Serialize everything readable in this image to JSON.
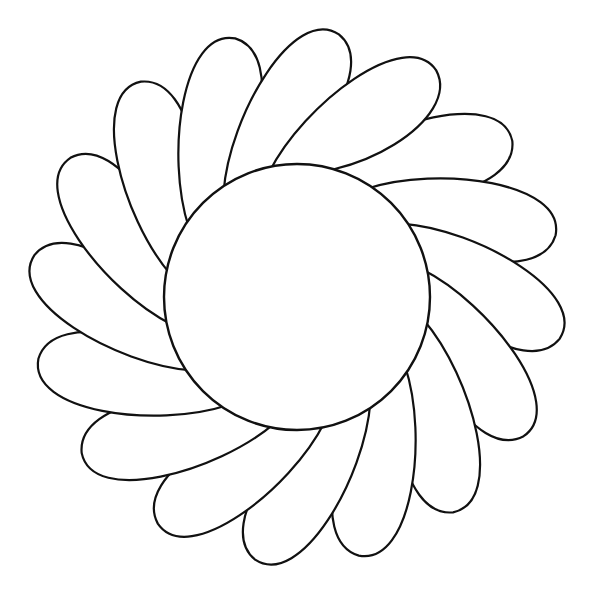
{
  "figure": {
    "background": "#ffffff",
    "stroke_color": "#111111",
    "center_circle": {
      "cx": 297,
      "cy": 297,
      "r": 133
    },
    "petals": {
      "count": 16,
      "inner_radius": 128,
      "outer_radius": 265,
      "width": 108,
      "swirl_degrees": 38,
      "start_angle_degrees": -80
    }
  }
}
